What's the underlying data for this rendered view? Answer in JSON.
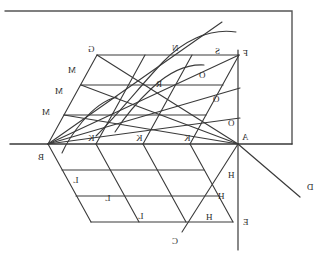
{
  "figure": {
    "background_color": "#ffffff",
    "stroke_color": "#3a3a3a",
    "border_color": "#555555",
    "orientation_note": "image is horizontally mirrored (letters appear reversed)",
    "canvas": {
      "width": 330,
      "height": 259
    }
  },
  "labels": [
    {
      "id": "label-G-top",
      "text": "G",
      "x": 88,
      "y": 45
    },
    {
      "id": "label-M-1",
      "text": "M",
      "x": 68,
      "y": 66
    },
    {
      "id": "label-M-2",
      "text": "M",
      "x": 55,
      "y": 87
    },
    {
      "id": "label-M-3",
      "text": "M",
      "x": 42,
      "y": 108
    },
    {
      "id": "label-B",
      "text": "B",
      "x": 38,
      "y": 153
    },
    {
      "id": "label-K-1",
      "text": "K",
      "x": 88,
      "y": 134
    },
    {
      "id": "label-K-2",
      "text": "K",
      "x": 136,
      "y": 134
    },
    {
      "id": "label-K-3",
      "text": "K",
      "x": 184,
      "y": 134
    },
    {
      "id": "label-L-1",
      "text": "L",
      "x": 73,
      "y": 176
    },
    {
      "id": "label-L-2",
      "text": "L",
      "x": 105,
      "y": 194
    },
    {
      "id": "label-L-3",
      "text": "L",
      "x": 138,
      "y": 212
    },
    {
      "id": "label-C-bottom",
      "text": "C",
      "x": 172,
      "y": 237
    },
    {
      "id": "label-H-1",
      "text": "H",
      "x": 228,
      "y": 171
    },
    {
      "id": "label-H-2",
      "text": "H",
      "x": 218,
      "y": 192
    },
    {
      "id": "label-H-3",
      "text": "H",
      "x": 206,
      "y": 213
    },
    {
      "id": "label-R",
      "text": "R",
      "x": 156,
      "y": 80
    },
    {
      "id": "label-N",
      "text": "N",
      "x": 172,
      "y": 44
    },
    {
      "id": "label-S",
      "text": "S",
      "x": 215,
      "y": 47
    },
    {
      "id": "label-O-1",
      "text": "O",
      "x": 199,
      "y": 71
    },
    {
      "id": "label-O-2",
      "text": "O",
      "x": 213,
      "y": 95
    },
    {
      "id": "label-O-3",
      "text": "O",
      "x": 228,
      "y": 119
    },
    {
      "id": "label-A",
      "text": "A",
      "x": 242,
      "y": 133
    },
    {
      "id": "label-F-top",
      "text": "F",
      "x": 243,
      "y": 49
    },
    {
      "id": "label-E-bottom",
      "text": "E",
      "x": 243,
      "y": 218
    },
    {
      "id": "label-D-right",
      "text": "D",
      "x": 307,
      "y": 183
    }
  ],
  "geometry": {
    "axes": {
      "horizontal_BA": {
        "name": "horizontal-axis-BA",
        "x1": 10,
        "y1": 144,
        "x2": 292,
        "y2": 144
      },
      "vertical_EF": {
        "name": "vertical-axis-EF",
        "x1": 238,
        "y1": 50,
        "x2": 238,
        "y2": 250
      },
      "diagonal_AD": {
        "name": "diagonal-axis-AD",
        "x1": 238,
        "y1": 144,
        "x2": 298,
        "y2": 196
      },
      "top_border": {
        "name": "top-border-line",
        "x1": 5,
        "y1": 11,
        "x2": 292,
        "y2": 11
      },
      "right_border": {
        "name": "right-border-line",
        "x1": 292,
        "y1": 11,
        "x2": 292,
        "y2": 144
      }
    },
    "grid": {
      "vertex_B": {
        "x": 48,
        "y": 144
      },
      "vertex_A": {
        "x": 238,
        "y": 144
      },
      "vertex_G": {
        "x": 97,
        "y": 55
      },
      "vertex_C": {
        "x": 182,
        "y": 232
      },
      "rows": 3,
      "cols": 4
    },
    "curves": [
      {
        "name": "arc-S-upper",
        "label": "S"
      },
      {
        "name": "arc-R-middle",
        "label": "R"
      },
      {
        "name": "arc-lower-left",
        "label": ""
      }
    ],
    "rays_from_B": 4,
    "rays_from_A": 4
  }
}
